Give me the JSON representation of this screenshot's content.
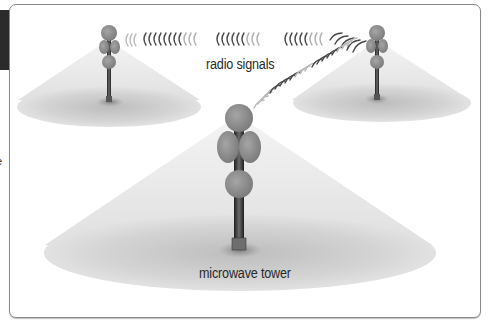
{
  "figure": {
    "labels": {
      "signals": "radio signals",
      "tower": "microwave tower"
    },
    "edge_text": "e",
    "towers": [
      {
        "id": "left",
        "role": "relay tower (small, back-left)"
      },
      {
        "id": "right",
        "role": "relay tower (small, back-right)"
      },
      {
        "id": "center",
        "role": "microwave tower (large, foreground)"
      }
    ],
    "colors": {
      "dish": "#8c8c8c",
      "mast": "#3a3a3a",
      "beam_cone": "#e6e6e6",
      "ground_ellipse": "#cfcfcf",
      "signal_arcs": "#4a4a4a",
      "frame_border": "#8a8a8a",
      "tab": "#2b2b2b"
    }
  }
}
